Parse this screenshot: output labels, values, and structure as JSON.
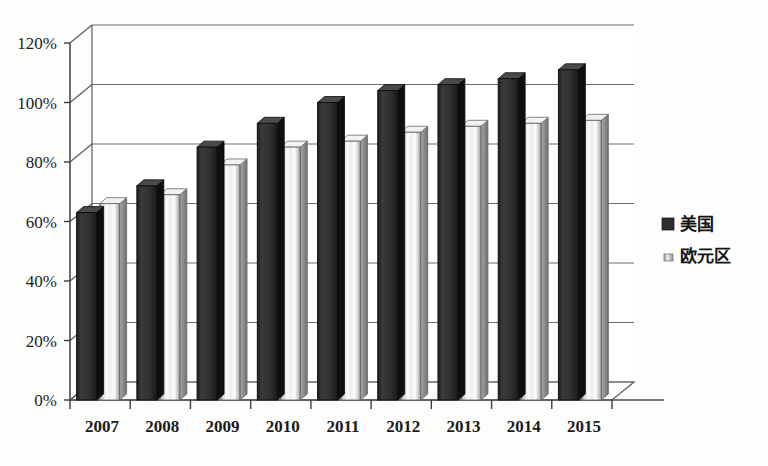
{
  "chart_data": {
    "type": "bar",
    "title": "",
    "subtitle": "",
    "xlabel": "",
    "ylabel": "",
    "categories": [
      "2007",
      "2008",
      "2009",
      "2010",
      "2011",
      "2012",
      "2013",
      "2014",
      "2015"
    ],
    "series": [
      {
        "name": "美国",
        "values": [
          63,
          72,
          85,
          93,
          100,
          104,
          106,
          108,
          111
        ],
        "color": "#2b2b2b"
      },
      {
        "name": "欧元区",
        "values": [
          66,
          69,
          79,
          85,
          87,
          90,
          92,
          93,
          94
        ],
        "color": "#e9e9e9"
      }
    ],
    "ytick_labels": [
      "0%",
      "20%",
      "40%",
      "60%",
      "80%",
      "100%",
      "120%"
    ],
    "ytick_values": [
      0,
      20,
      40,
      60,
      80,
      100,
      120
    ],
    "ylim": [
      0,
      120
    ],
    "value_unit": "%",
    "grid": true,
    "legend_position": "right",
    "style": "3d-grayscale-scan"
  },
  "legend": {
    "entries": [
      {
        "label": "美国",
        "swatch": "dark-solid"
      },
      {
        "label": "欧元区",
        "swatch": "light-gradient"
      }
    ]
  }
}
